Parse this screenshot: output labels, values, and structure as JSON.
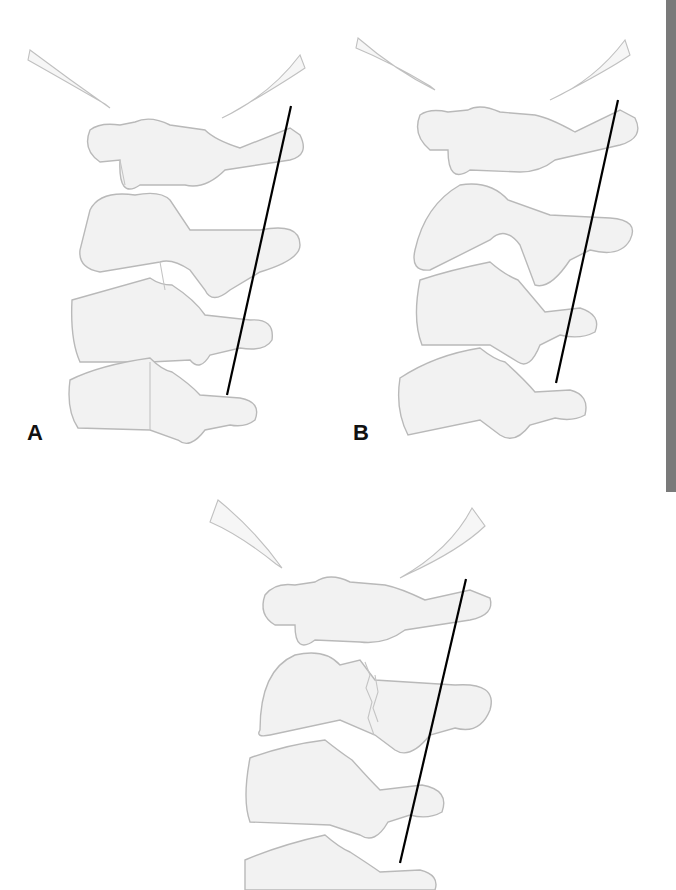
{
  "figure": {
    "panels": [
      {
        "id": "A",
        "label": "A",
        "description": "Lateral cervical spine, normal alignment with reference line"
      },
      {
        "id": "B",
        "label": "B",
        "description": "Lateral cervical spine, altered alignment with reference line"
      },
      {
        "id": "C",
        "label": "",
        "description": "Lateral cervical spine with fracture through posterior element and reference line"
      }
    ],
    "colors": {
      "bone_fill": "#f2f2f2",
      "bone_stroke": "#b9b9b9",
      "reference_line": "#000000",
      "edge_bar": "#7a7a7a"
    }
  }
}
